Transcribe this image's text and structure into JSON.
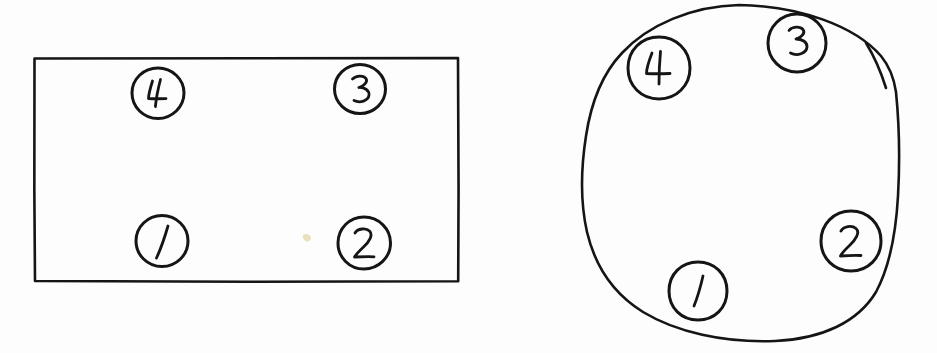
{
  "figure": {
    "background_color": "#fdfdfd",
    "ink_color": "#151515",
    "style": "hand-drawn pen sketch",
    "panels": [
      {
        "id": "rectangular-table",
        "name": "Rectangular table",
        "shape": "rectangle",
        "shape_label": "rectangle",
        "seat_count": 4,
        "seats": [
          {
            "label": "1",
            "position": "bottom-left",
            "cx": 162,
            "cy": 241,
            "r": 26
          },
          {
            "label": "2",
            "position": "bottom-right",
            "cx": 364,
            "cy": 243,
            "r": 26
          },
          {
            "label": "3",
            "position": "top-right",
            "cx": 360,
            "cy": 89,
            "r": 25
          },
          {
            "label": "4",
            "position": "top-left",
            "cx": 158,
            "cy": 93,
            "r": 26
          }
        ]
      },
      {
        "id": "round-table",
        "name": "Round table",
        "shape": "circle",
        "shape_label": "circle",
        "seat_count": 4,
        "seats": [
          {
            "label": "1",
            "position": "bottom",
            "cx": 698,
            "cy": 291,
            "r": 29
          },
          {
            "label": "2",
            "position": "lower-right",
            "cx": 851,
            "cy": 241,
            "r": 30
          },
          {
            "label": "3",
            "position": "upper-right",
            "cx": 797,
            "cy": 43,
            "r": 29
          },
          {
            "label": "4",
            "position": "upper-left",
            "cx": 659,
            "cy": 68,
            "r": 31
          }
        ]
      }
    ]
  }
}
